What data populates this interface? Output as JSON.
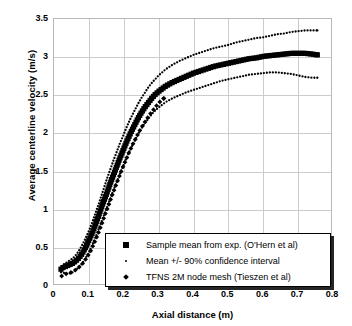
{
  "chart_data": {
    "type": "scatter",
    "title": "",
    "xlabel": "Axial distance (m)",
    "ylabel": "Average centerline velocity (m/s)",
    "xlim": [
      0,
      0.8
    ],
    "ylim": [
      0,
      3.5
    ],
    "xticks": [
      "0",
      "0.1",
      "0.2",
      "0.3",
      "0.4",
      "0.5",
      "0.6",
      "0.7",
      "0.8"
    ],
    "yticks": [
      "0",
      "0.5",
      "1",
      "1.5",
      "2",
      "2.5",
      "3",
      "3.5"
    ],
    "grid": true,
    "legend_position": "bottom-right",
    "series": [
      {
        "name": "Sample mean from exp. (O'Hern et al)",
        "marker": "square",
        "color": "#000000",
        "points": [
          [
            0.02,
            0.22
          ],
          [
            0.025,
            0.24
          ],
          [
            0.03,
            0.25
          ],
          [
            0.035,
            0.26
          ],
          [
            0.04,
            0.27
          ],
          [
            0.045,
            0.28
          ],
          [
            0.05,
            0.29
          ],
          [
            0.055,
            0.3
          ],
          [
            0.06,
            0.32
          ],
          [
            0.065,
            0.34
          ],
          [
            0.07,
            0.36
          ],
          [
            0.075,
            0.39
          ],
          [
            0.08,
            0.42
          ],
          [
            0.085,
            0.46
          ],
          [
            0.09,
            0.5
          ],
          [
            0.095,
            0.55
          ],
          [
            0.1,
            0.6
          ],
          [
            0.11,
            0.7
          ],
          [
            0.12,
            0.82
          ],
          [
            0.13,
            0.95
          ],
          [
            0.14,
            1.08
          ],
          [
            0.15,
            1.2
          ],
          [
            0.16,
            1.33
          ],
          [
            0.17,
            1.45
          ],
          [
            0.18,
            1.57
          ],
          [
            0.19,
            1.69
          ],
          [
            0.2,
            1.8
          ],
          [
            0.21,
            1.91
          ],
          [
            0.22,
            2.01
          ],
          [
            0.23,
            2.1
          ],
          [
            0.24,
            2.19
          ],
          [
            0.25,
            2.27
          ],
          [
            0.26,
            2.34
          ],
          [
            0.27,
            2.4
          ],
          [
            0.28,
            2.46
          ],
          [
            0.29,
            2.51
          ],
          [
            0.3,
            2.55
          ],
          [
            0.32,
            2.62
          ],
          [
            0.34,
            2.67
          ],
          [
            0.36,
            2.71
          ],
          [
            0.38,
            2.75
          ],
          [
            0.4,
            2.79
          ],
          [
            0.42,
            2.82
          ],
          [
            0.44,
            2.85
          ],
          [
            0.46,
            2.88
          ],
          [
            0.48,
            2.9
          ],
          [
            0.5,
            2.92
          ],
          [
            0.52,
            2.94
          ],
          [
            0.54,
            2.96
          ],
          [
            0.56,
            2.98
          ],
          [
            0.58,
            2.99
          ],
          [
            0.6,
            3.01
          ],
          [
            0.62,
            3.02
          ],
          [
            0.64,
            3.03
          ],
          [
            0.66,
            3.04
          ],
          [
            0.68,
            3.05
          ],
          [
            0.7,
            3.05
          ],
          [
            0.72,
            3.05
          ],
          [
            0.74,
            3.04
          ],
          [
            0.755,
            3.03
          ]
        ]
      },
      {
        "name": "Mean +/- 90% confidence interval",
        "marker": "dot",
        "color": "#000000",
        "note": "upper bound",
        "points": [
          [
            0.022,
            0.26
          ],
          [
            0.03,
            0.29
          ],
          [
            0.04,
            0.32
          ],
          [
            0.05,
            0.35
          ],
          [
            0.06,
            0.39
          ],
          [
            0.07,
            0.45
          ],
          [
            0.08,
            0.53
          ],
          [
            0.09,
            0.62
          ],
          [
            0.1,
            0.72
          ],
          [
            0.11,
            0.84
          ],
          [
            0.12,
            0.97
          ],
          [
            0.13,
            1.1
          ],
          [
            0.14,
            1.24
          ],
          [
            0.15,
            1.38
          ],
          [
            0.16,
            1.51
          ],
          [
            0.17,
            1.64
          ],
          [
            0.18,
            1.76
          ],
          [
            0.19,
            1.88
          ],
          [
            0.2,
            1.99
          ],
          [
            0.21,
            2.1
          ],
          [
            0.22,
            2.2
          ],
          [
            0.23,
            2.29
          ],
          [
            0.24,
            2.38
          ],
          [
            0.25,
            2.46
          ],
          [
            0.26,
            2.53
          ],
          [
            0.27,
            2.6
          ],
          [
            0.28,
            2.66
          ],
          [
            0.29,
            2.71
          ],
          [
            0.3,
            2.76
          ],
          [
            0.32,
            2.84
          ],
          [
            0.34,
            2.9
          ],
          [
            0.36,
            2.95
          ],
          [
            0.38,
            2.99
          ],
          [
            0.4,
            3.03
          ],
          [
            0.42,
            3.06
          ],
          [
            0.44,
            3.09
          ],
          [
            0.46,
            3.12
          ],
          [
            0.48,
            3.14
          ],
          [
            0.5,
            3.16
          ],
          [
            0.52,
            3.19
          ],
          [
            0.54,
            3.21
          ],
          [
            0.56,
            3.23
          ],
          [
            0.58,
            3.25
          ],
          [
            0.6,
            3.26
          ],
          [
            0.62,
            3.28
          ],
          [
            0.64,
            3.3
          ],
          [
            0.66,
            3.31
          ],
          [
            0.68,
            3.33
          ],
          [
            0.7,
            3.34
          ],
          [
            0.72,
            3.35
          ],
          [
            0.74,
            3.35
          ],
          [
            0.755,
            3.35
          ]
        ]
      },
      {
        "name": "Mean +/- 90% confidence interval",
        "marker": "dot",
        "color": "#000000",
        "note": "lower bound",
        "points": [
          [
            0.02,
            0.18
          ],
          [
            0.03,
            0.17
          ],
          [
            0.04,
            0.16
          ],
          [
            0.05,
            0.17
          ],
          [
            0.06,
            0.2
          ],
          [
            0.07,
            0.24
          ],
          [
            0.08,
            0.29
          ],
          [
            0.09,
            0.36
          ],
          [
            0.1,
            0.44
          ],
          [
            0.11,
            0.54
          ],
          [
            0.12,
            0.65
          ],
          [
            0.13,
            0.77
          ],
          [
            0.14,
            0.89
          ],
          [
            0.15,
            1.01
          ],
          [
            0.16,
            1.13
          ],
          [
            0.17,
            1.25
          ],
          [
            0.18,
            1.37
          ],
          [
            0.19,
            1.48
          ],
          [
            0.2,
            1.59
          ],
          [
            0.21,
            1.7
          ],
          [
            0.22,
            1.8
          ],
          [
            0.23,
            1.89
          ],
          [
            0.24,
            1.98
          ],
          [
            0.25,
            2.06
          ],
          [
            0.26,
            2.13
          ],
          [
            0.27,
            2.19
          ],
          [
            0.28,
            2.25
          ],
          [
            0.29,
            2.3
          ],
          [
            0.3,
            2.34
          ],
          [
            0.32,
            2.41
          ],
          [
            0.34,
            2.46
          ],
          [
            0.36,
            2.5
          ],
          [
            0.38,
            2.54
          ],
          [
            0.4,
            2.57
          ],
          [
            0.42,
            2.6
          ],
          [
            0.44,
            2.63
          ],
          [
            0.46,
            2.66
          ],
          [
            0.48,
            2.69
          ],
          [
            0.5,
            2.71
          ],
          [
            0.52,
            2.73
          ],
          [
            0.54,
            2.75
          ],
          [
            0.56,
            2.77
          ],
          [
            0.58,
            2.78
          ],
          [
            0.6,
            2.79
          ],
          [
            0.62,
            2.8
          ],
          [
            0.64,
            2.8
          ],
          [
            0.66,
            2.79
          ],
          [
            0.68,
            2.78
          ],
          [
            0.7,
            2.76
          ],
          [
            0.72,
            2.74
          ],
          [
            0.74,
            2.73
          ],
          [
            0.755,
            2.73
          ]
        ]
      },
      {
        "name": "TFNS 2M node mesh (Tieszen et al)",
        "marker": "diamond",
        "color": "#000000",
        "points": [
          [
            0.022,
            0.13
          ],
          [
            0.035,
            0.16
          ],
          [
            0.045,
            0.17
          ],
          [
            0.055,
            0.19
          ],
          [
            0.065,
            0.22
          ],
          [
            0.075,
            0.26
          ],
          [
            0.085,
            0.31
          ],
          [
            0.095,
            0.38
          ],
          [
            0.105,
            0.46
          ],
          [
            0.115,
            0.56
          ],
          [
            0.125,
            0.67
          ],
          [
            0.135,
            0.79
          ],
          [
            0.145,
            0.92
          ],
          [
            0.155,
            1.04
          ],
          [
            0.165,
            1.17
          ],
          [
            0.175,
            1.29
          ],
          [
            0.185,
            1.41
          ],
          [
            0.195,
            1.53
          ],
          [
            0.205,
            1.64
          ],
          [
            0.215,
            1.75
          ],
          [
            0.225,
            1.85
          ],
          [
            0.235,
            1.94
          ],
          [
            0.245,
            2.03
          ],
          [
            0.255,
            2.11
          ],
          [
            0.265,
            2.18
          ],
          [
            0.275,
            2.25
          ],
          [
            0.285,
            2.31
          ],
          [
            0.295,
            2.37
          ],
          [
            0.305,
            2.42
          ],
          [
            0.315,
            2.46
          ]
        ]
      }
    ]
  },
  "legend": {
    "items": [
      {
        "key": "square",
        "label": "Sample mean from exp. (O'Hern et al)"
      },
      {
        "key": "dot",
        "label": "Mean +/- 90% confidence interval"
      },
      {
        "key": "diamond",
        "label": "TFNS 2M node mesh (Tieszen et al)"
      }
    ]
  },
  "colors": {
    "grid": "#cccccc",
    "frame": "#b8b8b8",
    "data": "#000000"
  }
}
